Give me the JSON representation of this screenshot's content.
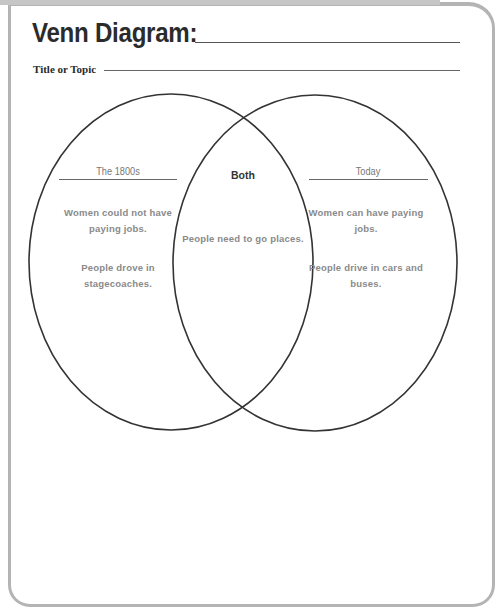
{
  "worksheet": {
    "title": "Venn Diagram:",
    "title_blank": "",
    "topic_label": "Title or Topic",
    "topic_blank": ""
  },
  "venn": {
    "left": {
      "heading": "The 1800s",
      "entries": [
        "Women could not have paying jobs.",
        "People drove in stagecoaches."
      ]
    },
    "middle": {
      "heading": "Both",
      "entries": [
        "People need to go places."
      ]
    },
    "right": {
      "heading": "Today",
      "entries": [
        "Women can have paying jobs.",
        "People drive in cars and buses."
      ]
    }
  },
  "colors": {
    "frame": "#b4b4b4",
    "title_text": "#2b2b2b",
    "entry_text": "#8a8a8a",
    "circle_stroke": "#333333"
  }
}
